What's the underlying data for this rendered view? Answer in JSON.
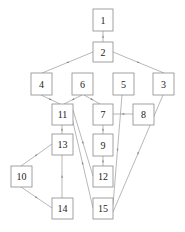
{
  "diagram": {
    "type": "directed-graph",
    "nodes": [
      {
        "id": "1",
        "label": "1",
        "x": 93,
        "y": 9,
        "w": 20,
        "h": 22
      },
      {
        "id": "2",
        "label": "2",
        "x": 93,
        "y": 42,
        "w": 20,
        "h": 20
      },
      {
        "id": "4",
        "label": "4",
        "x": 31,
        "y": 73,
        "w": 21,
        "h": 22
      },
      {
        "id": "6",
        "label": "6",
        "x": 72,
        "y": 73,
        "w": 21,
        "h": 22
      },
      {
        "id": "5",
        "label": "5",
        "x": 113,
        "y": 73,
        "w": 21,
        "h": 22
      },
      {
        "id": "3",
        "label": "3",
        "x": 153,
        "y": 73,
        "w": 21,
        "h": 22
      },
      {
        "id": "11",
        "label": "11",
        "x": 52,
        "y": 104,
        "w": 21,
        "h": 21
      },
      {
        "id": "7",
        "label": "7",
        "x": 93,
        "y": 104,
        "w": 20,
        "h": 21
      },
      {
        "id": "8",
        "label": "8",
        "x": 133,
        "y": 104,
        "w": 21,
        "h": 21
      },
      {
        "id": "13",
        "label": "13",
        "x": 52,
        "y": 134,
        "w": 21,
        "h": 21
      },
      {
        "id": "9",
        "label": "9",
        "x": 93,
        "y": 134,
        "w": 20,
        "h": 22
      },
      {
        "id": "10",
        "label": "10",
        "x": 11,
        "y": 166,
        "w": 21,
        "h": 21
      },
      {
        "id": "12",
        "label": "12",
        "x": 93,
        "y": 166,
        "w": 20,
        "h": 21
      },
      {
        "id": "14",
        "label": "14",
        "x": 52,
        "y": 198,
        "w": 21,
        "h": 21
      },
      {
        "id": "15",
        "label": "15",
        "x": 93,
        "y": 198,
        "w": 20,
        "h": 21
      }
    ],
    "edges": [
      {
        "from": "2",
        "to": "1",
        "x1": 103,
        "y1": 42,
        "x2": 103,
        "y2": 31
      },
      {
        "from": "2",
        "to": "4",
        "x1": 93,
        "y1": 52,
        "x2": 42,
        "y2": 73
      },
      {
        "from": "2",
        "to": "3",
        "x1": 113,
        "y1": 52,
        "x2": 164,
        "y2": 73
      },
      {
        "from": "4",
        "to": "11",
        "x1": 41,
        "y1": 95,
        "x2": 60,
        "y2": 104
      },
      {
        "from": "6",
        "to": "11",
        "x1": 82,
        "y1": 95,
        "x2": 64,
        "y2": 104
      },
      {
        "from": "6",
        "to": "7",
        "x1": 84,
        "y1": 95,
        "x2": 100,
        "y2": 104
      },
      {
        "from": "8",
        "to": "7",
        "x1": 133,
        "y1": 114,
        "x2": 113,
        "y2": 114
      },
      {
        "from": "9",
        "to": "7",
        "x1": 103,
        "y1": 134,
        "x2": 103,
        "y2": 125
      },
      {
        "from": "12",
        "to": "9",
        "x1": 103,
        "y1": 166,
        "x2": 103,
        "y2": 156
      },
      {
        "from": "13",
        "to": "11",
        "x1": 62,
        "y1": 134,
        "x2": 62,
        "y2": 125
      },
      {
        "from": "14",
        "to": "13",
        "x1": 62,
        "y1": 198,
        "x2": 62,
        "y2": 155
      },
      {
        "from": "10",
        "to": "13",
        "x1": 21,
        "y1": 166,
        "x2": 52,
        "y2": 144
      },
      {
        "from": "10",
        "to": "14",
        "x1": 21,
        "y1": 187,
        "x2": 52,
        "y2": 208
      },
      {
        "from": "11",
        "to": "12",
        "x1": 73,
        "y1": 110,
        "x2": 93,
        "y2": 176
      },
      {
        "from": "15",
        "to": "11",
        "x1": 93,
        "y1": 208,
        "x2": 72,
        "y2": 118
      },
      {
        "from": "5",
        "to": "15",
        "x1": 122,
        "y1": 95,
        "x2": 113,
        "y2": 205
      },
      {
        "from": "3",
        "to": "15",
        "x1": 163,
        "y1": 95,
        "x2": 113,
        "y2": 212
      }
    ]
  }
}
